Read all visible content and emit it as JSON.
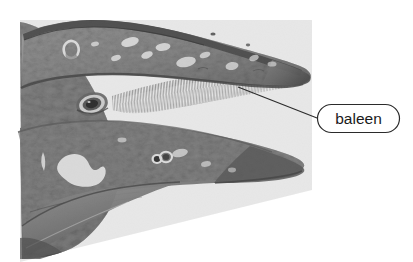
{
  "figure": {
    "background_color": "#ffffff",
    "rendering_style": "grayscale-halftone-engraving"
  },
  "annotations": [
    {
      "id": "baleen-callout",
      "label": "baleen",
      "shape": "rounded-rectangle",
      "text_color": "#1a1a1a",
      "border_color": "#2b2b2b",
      "fill_color": "#ffffff",
      "box": {
        "x": 317,
        "y": 104,
        "width": 83,
        "height": 29,
        "radius": 14
      },
      "leader_line": {
        "from": {
          "x": 317,
          "y": 118
        },
        "to": {
          "x": 238,
          "y": 87
        },
        "color": "#2b2b2b",
        "width": 1
      }
    }
  ],
  "anatomy": {
    "parts": [
      {
        "name": "upper-jaw",
        "description": "mottled gray rostrum with dark dorsal ridge and white barnacle patches"
      },
      {
        "name": "lower-jaw",
        "description": "mottled gray mandible with white barnacle clusters"
      },
      {
        "name": "baleen",
        "description": "fine vertical plates hanging from upper jaw inside the mouth gap"
      },
      {
        "name": "eye",
        "description": "oval eye with dark pupil and light ring"
      },
      {
        "name": "barnacle-patch",
        "description": "irregular white encrustations on skin"
      },
      {
        "name": "mouth-gap",
        "description": "white opening between upper and lower jaw"
      }
    ]
  },
  "palette": {
    "skin_mid": "#8d8d8d",
    "skin_dark": "#4a4a4a",
    "skin_darkest": "#2e2e2e",
    "skin_light": "#bdbdbd",
    "barnacle_white": "#f2f2f2",
    "baleen_stripe": "#9a9a9a",
    "background": "#ffffff",
    "outline": "#2b2b2b"
  }
}
